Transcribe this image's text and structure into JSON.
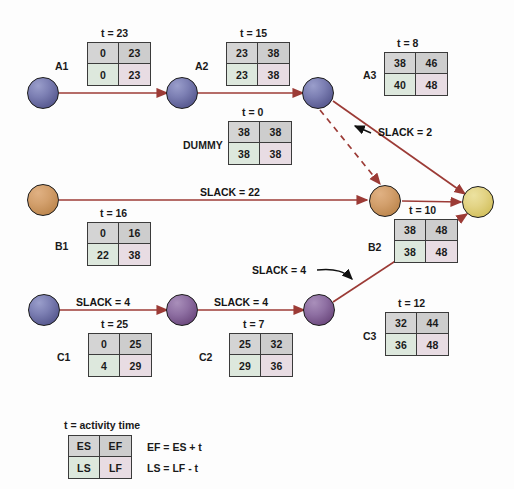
{
  "activities": [
    {
      "id": "A1",
      "name": "A1",
      "t": "t = 23",
      "es": "0",
      "ef": "23",
      "ls": "0",
      "lf": "23"
    },
    {
      "id": "A2",
      "name": "A2",
      "t": "t = 15",
      "es": "23",
      "ef": "38",
      "ls": "23",
      "lf": "38"
    },
    {
      "id": "A3",
      "name": "A3",
      "t": "t = 8",
      "es": "38",
      "ef": "46",
      "ls": "40",
      "lf": "48"
    },
    {
      "id": "DUMMY",
      "name": "DUMMY",
      "t": "t = 0",
      "es": "38",
      "ef": "38",
      "ls": "38",
      "lf": "38"
    },
    {
      "id": "B1",
      "name": "B1",
      "t": "t = 16",
      "es": "0",
      "ef": "16",
      "ls": "22",
      "lf": "38"
    },
    {
      "id": "B2",
      "name": "B2",
      "t": "t = 10",
      "es": "38",
      "ef": "48",
      "ls": "38",
      "lf": "48"
    },
    {
      "id": "C1",
      "name": "C1",
      "t": "t = 25",
      "es": "0",
      "ef": "25",
      "ls": "4",
      "lf": "29"
    },
    {
      "id": "C2",
      "name": "C2",
      "t": "t = 7",
      "es": "25",
      "ef": "32",
      "ls": "29",
      "lf": "36"
    },
    {
      "id": "C3",
      "name": "C3",
      "t": "t = 12",
      "es": "32",
      "ef": "44",
      "ls": "36",
      "lf": "48"
    }
  ],
  "slack_labels": [
    {
      "id": "slack-a3",
      "text": "SLACK = 2"
    },
    {
      "id": "slack-b1",
      "text": "SLACK = 22"
    },
    {
      "id": "slack-c3",
      "text": "SLACK = 4"
    },
    {
      "id": "slack-c1",
      "text": "SLACK = 4"
    },
    {
      "id": "slack-c2",
      "text": "SLACK = 4"
    }
  ],
  "legend": {
    "activity_time": "t = activity time",
    "es": "ES",
    "ef": "EF",
    "ls": "LS",
    "lf": "LF",
    "eq1": "EF = ES + t",
    "eq2": "LS = LF - t"
  },
  "colors": {
    "arrow": "#9c3b36",
    "box_border": "#3b3b3b",
    "cell_es": "#d4d4d4",
    "cell_ef": "#cdcdcd",
    "cell_ls": "#dde8dd",
    "cell_lf": "#e8dce3",
    "node_purple": "#6a6ca3",
    "node_violet": "#7c5a90",
    "node_orange": "#cf9a66",
    "node_gold": "#e0d17e"
  }
}
